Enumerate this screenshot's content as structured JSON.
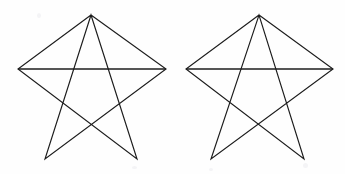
{
  "figure": {
    "background_color": "#fefefe",
    "stroke_color": "#1c1c1c",
    "stroke_width": 1.15,
    "width": 345,
    "height": 174,
    "shape_count": 2,
    "shape_type": "pentagram",
    "shapes": [
      {
        "name": "left-pentagram",
        "label": "Left star",
        "vertices": [
          {
            "name": "apex",
            "x": 91,
            "y": 15
          },
          {
            "name": "right-point",
            "x": 166,
            "y": 69
          },
          {
            "name": "bottom-left-point",
            "x": 45,
            "y": 159
          },
          {
            "name": "apex-return-top",
            "x": 91,
            "y": 15
          },
          {
            "name": "bottom-right-point",
            "x": 137,
            "y": 159
          },
          {
            "name": "left-point",
            "x": 18,
            "y": 69
          }
        ],
        "path": "M 91 15 L 166 69 L 45 159 L 91 15 L 137 159 L 18 69 Z",
        "crossbar": {
          "x1": 18,
          "y1": 69,
          "x2": 166,
          "y2": 69
        }
      },
      {
        "name": "right-pentagram",
        "label": "Right star",
        "vertices": [
          {
            "name": "apex",
            "x": 259,
            "y": 15
          },
          {
            "name": "right-point",
            "x": 333,
            "y": 69
          },
          {
            "name": "bottom-left-point",
            "x": 211,
            "y": 159
          },
          {
            "name": "apex-return-top",
            "x": 259,
            "y": 15
          },
          {
            "name": "bottom-right-point",
            "x": 304,
            "y": 159
          },
          {
            "name": "left-point",
            "x": 186,
            "y": 69
          }
        ],
        "path": "M 259 15 L 333 69 L 211 159 L 259 15 L 304 159 L 186 69 Z",
        "crossbar": {
          "x1": 186,
          "y1": 69,
          "x2": 333,
          "y2": 69
        }
      }
    ]
  }
}
